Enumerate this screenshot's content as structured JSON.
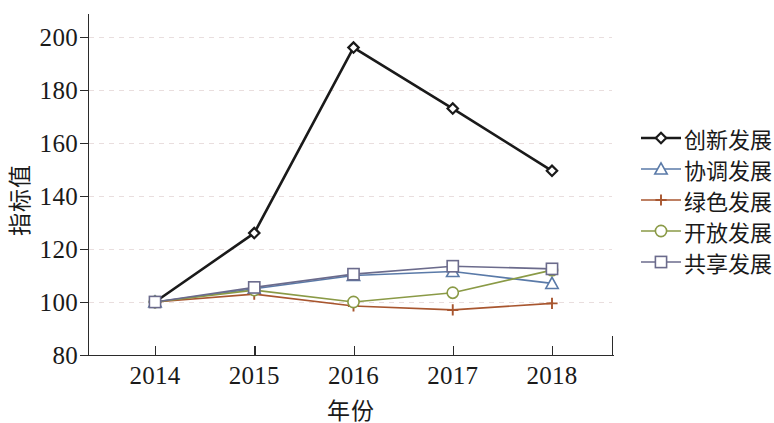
{
  "chart_data": {
    "type": "line",
    "title": "",
    "xlabel": "年份",
    "ylabel": "指标值",
    "x": [
      2014,
      2015,
      2016,
      2017,
      2018
    ],
    "categories": [
      "2014",
      "2015",
      "2016",
      "2017",
      "2018"
    ],
    "xticklabels": [
      "2014",
      "2015",
      "2016",
      "2017",
      "2018"
    ],
    "yticklabels": [
      "80",
      "100",
      "120",
      "140",
      "160",
      "180",
      "200"
    ],
    "yticks": [
      80,
      100,
      120,
      140,
      160,
      180,
      200
    ],
    "ylim": [
      80,
      200
    ],
    "xlim": [
      2013.6,
      2018.5
    ],
    "grid": "horizontal-dashed",
    "legend_position": "right",
    "series": [
      {
        "name": "创新发展",
        "color": "#1a1a1a",
        "marker": "diamond",
        "values": [
          100,
          126,
          196,
          173,
          149.5
        ]
      },
      {
        "name": "协调发展",
        "color": "#5a7aa8",
        "marker": "triangle",
        "values": [
          100,
          105,
          110,
          111.5,
          107
        ]
      },
      {
        "name": "绿色发展",
        "color": "#a8562f",
        "marker": "plus",
        "values": [
          100,
          103,
          98.5,
          97,
          99.5
        ]
      },
      {
        "name": "开放发展",
        "color": "#8a9a46",
        "marker": "circle",
        "values": [
          100,
          104.5,
          100,
          103.5,
          112
        ]
      },
      {
        "name": "共享发展",
        "color": "#6b6b8c",
        "marker": "square",
        "values": [
          100,
          105.5,
          110.5,
          113.5,
          112.5
        ]
      }
    ]
  }
}
